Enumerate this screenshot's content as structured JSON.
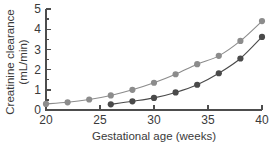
{
  "chart_data": {
    "type": "line",
    "title": "",
    "subtitle": "",
    "xlabel": "Gestational age (weeks)",
    "ylabel": "Creatinine clearance (mL/min)",
    "ylabel_line1": "Creatinine clearance",
    "ylabel_line2": "(mL/min)",
    "xlim": [
      20,
      40
    ],
    "ylim": [
      0,
      5
    ],
    "xticks": [
      20,
      25,
      30,
      35,
      40
    ],
    "yticks": [
      0,
      1,
      2,
      3,
      4,
      5
    ],
    "xtick_labels": [
      "20",
      "25",
      "30",
      "35",
      "40"
    ],
    "ytick_labels": [
      "0",
      "1",
      "2",
      "3",
      "4",
      "5"
    ],
    "grid": false,
    "legend": "none",
    "minor_yticks": [
      0.5,
      1.5,
      2.5,
      3.5,
      4.5
    ],
    "series": [
      {
        "name": "upper-curve",
        "color": "#8c8c8c",
        "marker": "circle",
        "x": [
          20,
          22,
          24,
          26,
          28,
          30,
          32,
          34,
          36,
          38,
          40
        ],
        "values": [
          0.3,
          0.38,
          0.52,
          0.72,
          1.0,
          1.35,
          1.77,
          2.27,
          2.68,
          3.42,
          4.4
        ]
      },
      {
        "name": "lower-curve",
        "color": "#4a4a4a",
        "marker": "circle",
        "x": [
          26,
          28,
          30,
          32,
          34,
          36,
          38,
          40
        ],
        "values": [
          0.28,
          0.43,
          0.6,
          0.87,
          1.25,
          1.82,
          2.55,
          3.62
        ]
      }
    ]
  },
  "colors": {
    "axis": "#4d4d4d",
    "text": "#3a3a3a",
    "series_light": "#8c8c8c",
    "series_dark": "#4a4a4a",
    "background": "#ffffff"
  }
}
